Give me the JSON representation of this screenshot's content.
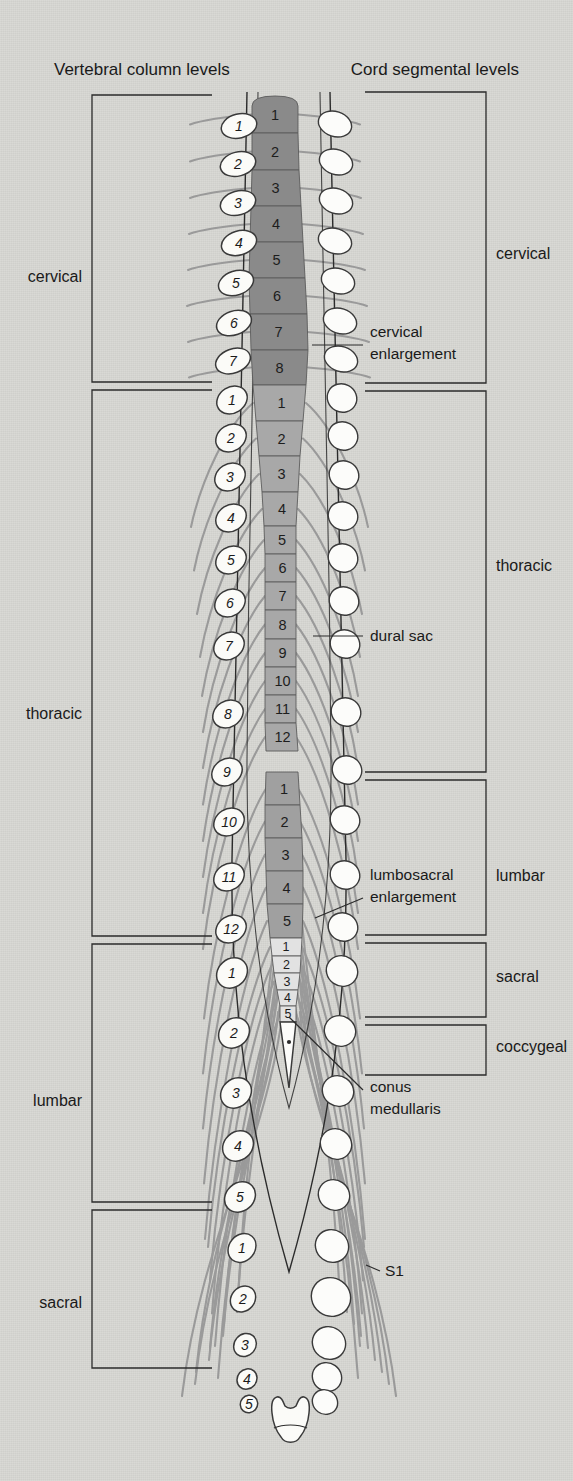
{
  "figure": {
    "title_left": "Vertebral column levels",
    "title_right": "Cord segmental levels"
  },
  "colors": {
    "background": "#d6d6d2",
    "cervical_segment": "#8a8a8a",
    "thoracic_segment": "#a8a8a8",
    "lumbar_segment": "#a0a0a0",
    "sacral_segment": "#e2e2e2",
    "conus_tip": "#fbfbf8",
    "nerve_root": "#9a9a9a",
    "outline": "#2b2b2b",
    "text": "#1a1a1a"
  },
  "left_brackets": [
    {
      "label": "cervical",
      "y_top": 95,
      "y_bottom": 382,
      "label_y": 277
    },
    {
      "label": "thoracic",
      "y_top": 390,
      "y_bottom": 936,
      "label_y": 714
    },
    {
      "label": "lumbar",
      "y_top": 944,
      "y_bottom": 1202,
      "label_y": 1101
    },
    {
      "label": "sacral",
      "y_top": 1210,
      "y_bottom": 1368,
      "label_y": 1303
    }
  ],
  "right_brackets": [
    {
      "label": "cervical",
      "y_top": 92,
      "y_bottom": 383,
      "label_y": 254
    },
    {
      "label": "thoracic",
      "y_top": 391,
      "y_bottom": 772,
      "label_y": 566
    },
    {
      "label": "lumbar",
      "y_top": 780,
      "y_bottom": 935,
      "label_y": 876
    },
    {
      "label": "sacral",
      "y_top": 943,
      "y_bottom": 1017,
      "label_y": 977
    },
    {
      "label": "coccygeal",
      "y_top": 1025,
      "y_bottom": 1075,
      "label_y": 1047
    }
  ],
  "annotations": [
    {
      "name": "cervical-enlargement",
      "lines": [
        "cervical",
        "enlargement"
      ],
      "x": 370,
      "y": 337,
      "leader": {
        "x1": 363,
        "y1": 345,
        "x2": 312,
        "y2": 345
      }
    },
    {
      "name": "dural-sac",
      "lines": [
        "dural sac"
      ],
      "x": 370,
      "y": 641,
      "leader": {
        "x1": 363,
        "y1": 636,
        "x2": 313,
        "y2": 636
      }
    },
    {
      "name": "lumbosacral-enlargement",
      "lines": [
        "lumbosacral",
        "enlargement"
      ],
      "x": 370,
      "y": 880,
      "leader": {
        "x1": 363,
        "y1": 898,
        "x2": 315,
        "y2": 918
      }
    },
    {
      "name": "conus-medullaris",
      "lines": [
        "conus",
        "medullaris"
      ],
      "x": 370,
      "y": 1092,
      "leader": {
        "x1": 363,
        "y1": 1090,
        "x2": 289,
        "y2": 1017
      }
    },
    {
      "name": "s1-label",
      "lines": [
        "S1"
      ],
      "x": 385,
      "y": 1276,
      "leader": {
        "x1": 380,
        "y1": 1271,
        "x2": 366,
        "y2": 1265
      }
    }
  ],
  "vertebrae": {
    "cervical": {
      "count": 7,
      "labels": [
        "1",
        "2",
        "3",
        "4",
        "5",
        "6",
        "7"
      ]
    },
    "thoracic": {
      "count": 12,
      "labels": [
        "1",
        "2",
        "3",
        "4",
        "5",
        "6",
        "7",
        "8",
        "9",
        "10",
        "11",
        "12"
      ]
    },
    "lumbar": {
      "count": 5,
      "labels": [
        "1",
        "2",
        "3",
        "4",
        "5"
      ]
    },
    "sacral": {
      "count": 5,
      "labels": [
        "1",
        "2",
        "3",
        "4",
        "5"
      ]
    }
  },
  "vertebra_items": [
    {
      "region": "cervical",
      "label": "1",
      "x": 239,
      "y": 126
    },
    {
      "region": "cervical",
      "label": "2",
      "x": 238,
      "y": 164
    },
    {
      "region": "cervical",
      "label": "3",
      "x": 238,
      "y": 203
    },
    {
      "region": "cervical",
      "label": "4",
      "x": 239,
      "y": 243
    },
    {
      "region": "cervical",
      "label": "5",
      "x": 236,
      "y": 283
    },
    {
      "region": "cervical",
      "label": "6",
      "x": 234,
      "y": 323
    },
    {
      "region": "cervical",
      "label": "7",
      "x": 233,
      "y": 361
    },
    {
      "region": "thoracic",
      "label": "1",
      "x": 232,
      "y": 400
    },
    {
      "region": "thoracic",
      "label": "2",
      "x": 231,
      "y": 438
    },
    {
      "region": "thoracic",
      "label": "3",
      "x": 230,
      "y": 477
    },
    {
      "region": "thoracic",
      "label": "4",
      "x": 231,
      "y": 518
    },
    {
      "region": "thoracic",
      "label": "5",
      "x": 231,
      "y": 560
    },
    {
      "region": "thoracic",
      "label": "6",
      "x": 230,
      "y": 603
    },
    {
      "region": "thoracic",
      "label": "7",
      "x": 229,
      "y": 646
    },
    {
      "region": "thoracic",
      "label": "8",
      "x": 228,
      "y": 714
    },
    {
      "region": "thoracic",
      "label": "9",
      "x": 227,
      "y": 772
    },
    {
      "region": "thoracic",
      "label": "10",
      "x": 229,
      "y": 822
    },
    {
      "region": "thoracic",
      "label": "11",
      "x": 229,
      "y": 877
    },
    {
      "region": "thoracic",
      "label": "12",
      "x": 231,
      "y": 929
    },
    {
      "region": "lumbar",
      "label": "1",
      "x": 232,
      "y": 973
    },
    {
      "region": "lumbar",
      "label": "2",
      "x": 234,
      "y": 1033
    },
    {
      "region": "lumbar",
      "label": "3",
      "x": 236,
      "y": 1093
    },
    {
      "region": "lumbar",
      "label": "4",
      "x": 238,
      "y": 1146
    },
    {
      "region": "lumbar",
      "label": "5",
      "x": 240,
      "y": 1197
    },
    {
      "region": "sacral",
      "label": "1",
      "x": 242,
      "y": 1248
    },
    {
      "region": "sacral",
      "label": "2",
      "x": 243,
      "y": 1299
    },
    {
      "region": "sacral",
      "label": "3",
      "x": 245,
      "y": 1345
    },
    {
      "region": "sacral",
      "label": "4",
      "x": 247,
      "y": 1379
    },
    {
      "region": "sacral",
      "label": "5",
      "x": 249,
      "y": 1404
    }
  ],
  "cord_segments": {
    "cervical": {
      "labels": [
        "1",
        "2",
        "3",
        "4",
        "5",
        "6",
        "7",
        "8"
      ],
      "y_top": 96,
      "y_bottom": 385,
      "fill": "#8a8a8a"
    },
    "thoracic": {
      "labels": [
        "1",
        "2",
        "3",
        "4",
        "5",
        "6",
        "7",
        "8",
        "9",
        "10",
        "11",
        "12"
      ],
      "y_top": 385,
      "y_bottom": 772,
      "fill": "#a8a8a8"
    },
    "lumbar": {
      "labels": [
        "1",
        "2",
        "3",
        "4",
        "5"
      ],
      "y_top": 772,
      "y_bottom": 938,
      "fill": "#a0a0a0"
    },
    "sacral": {
      "labels": [
        "1",
        "2",
        "3",
        "4",
        "5"
      ],
      "y_top": 938,
      "y_bottom": 1022,
      "fill": "#e2e2e2"
    }
  },
  "cord_segment_rows": [
    {
      "region": "cervical",
      "label": "1",
      "y0": 96,
      "y1": 133,
      "lx": 252,
      "rx": 298
    },
    {
      "region": "cervical",
      "label": "2",
      "y0": 133,
      "y1": 170,
      "lx": 252,
      "rx": 298
    },
    {
      "region": "cervical",
      "label": "3",
      "y0": 170,
      "y1": 206,
      "lx": 252,
      "rx": 299
    },
    {
      "region": "cervical",
      "label": "4",
      "y0": 206,
      "y1": 242,
      "lx": 251,
      "rx": 301
    },
    {
      "region": "cervical",
      "label": "5",
      "y0": 242,
      "y1": 278,
      "lx": 250,
      "rx": 303
    },
    {
      "region": "cervical",
      "label": "6",
      "y0": 278,
      "y1": 314,
      "lx": 249,
      "rx": 305
    },
    {
      "region": "cervical",
      "label": "7",
      "y0": 314,
      "y1": 350,
      "lx": 250,
      "rx": 307
    },
    {
      "region": "cervical",
      "label": "8",
      "y0": 350,
      "y1": 385,
      "lx": 251,
      "rx": 308
    },
    {
      "region": "thoracic",
      "label": "1",
      "y0": 385,
      "y1": 421,
      "lx": 253,
      "rx": 306
    },
    {
      "region": "thoracic",
      "label": "2",
      "y0": 421,
      "y1": 456,
      "lx": 256,
      "rx": 303
    },
    {
      "region": "thoracic",
      "label": "3",
      "y0": 456,
      "y1": 492,
      "lx": 259,
      "rx": 300
    },
    {
      "region": "thoracic",
      "label": "4",
      "y0": 492,
      "y1": 526,
      "lx": 262,
      "rx": 298
    },
    {
      "region": "thoracic",
      "label": "5",
      "y0": 526,
      "y1": 554,
      "lx": 264,
      "rx": 296
    },
    {
      "region": "thoracic",
      "label": "6",
      "y0": 554,
      "y1": 582,
      "lx": 265,
      "rx": 296
    },
    {
      "region": "thoracic",
      "label": "7",
      "y0": 582,
      "y1": 610,
      "lx": 265,
      "rx": 296
    },
    {
      "region": "thoracic",
      "label": "8",
      "y0": 610,
      "y1": 639,
      "lx": 265,
      "rx": 296
    },
    {
      "region": "thoracic",
      "label": "9",
      "y0": 639,
      "y1": 667,
      "lx": 265,
      "rx": 296
    },
    {
      "region": "thoracic",
      "label": "10",
      "y0": 667,
      "y1": 695,
      "lx": 265,
      "rx": 296
    },
    {
      "region": "thoracic",
      "label": "11",
      "y0": 695,
      "y1": 723,
      "lx": 265,
      "rx": 296
    },
    {
      "region": "thoracic",
      "label": "12",
      "y0": 723,
      "y1": 751,
      "lx": 265,
      "rx": 296
    },
    {
      "region": "lumbar",
      "label": "1",
      "y0": 772,
      "y1": 805,
      "lx": 266,
      "rx": 298
    },
    {
      "region": "lumbar",
      "label": "2",
      "y0": 805,
      "y1": 838,
      "lx": 265,
      "rx": 300
    },
    {
      "region": "lumbar",
      "label": "3",
      "y0": 838,
      "y1": 871,
      "lx": 265,
      "rx": 302
    },
    {
      "region": "lumbar",
      "label": "4",
      "y0": 871,
      "y1": 904,
      "lx": 266,
      "rx": 303
    },
    {
      "region": "lumbar",
      "label": "5",
      "y0": 904,
      "y1": 938,
      "lx": 267,
      "rx": 303
    },
    {
      "region": "sacral",
      "label": "1",
      "y0": 938,
      "y1": 956,
      "lx": 270,
      "rx": 302
    },
    {
      "region": "sacral",
      "label": "2",
      "y0": 956,
      "y1": 973,
      "lx": 272,
      "rx": 301
    },
    {
      "region": "sacral",
      "label": "3",
      "y0": 973,
      "y1": 990,
      "lx": 274,
      "rx": 300
    },
    {
      "region": "sacral",
      "label": "4",
      "y0": 990,
      "y1": 1006,
      "lx": 277,
      "rx": 298
    },
    {
      "region": "sacral",
      "label": "5",
      "y0": 1006,
      "y1": 1022,
      "lx": 280,
      "rx": 296
    }
  ]
}
